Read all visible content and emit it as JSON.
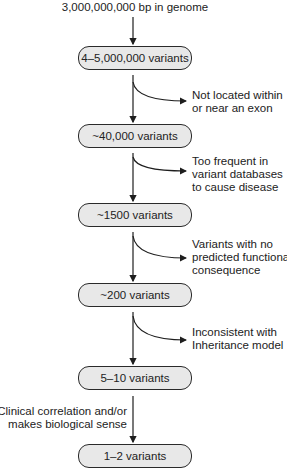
{
  "diagram": {
    "type": "variant-filtering-flowchart",
    "start_label": "3,000,000,000 bp in genome",
    "stages": [
      {
        "label": "4–5,000,000 variants"
      },
      {
        "label": "~40,000 variants"
      },
      {
        "label": "~1500 variants"
      },
      {
        "label": "~200 variants"
      },
      {
        "label": "5–10 variants"
      },
      {
        "label": "1–2 variants"
      }
    ],
    "filters": [
      {
        "lines": [
          "Not located within",
          "or near an exon"
        ],
        "side": "right"
      },
      {
        "lines": [
          "Too frequent in",
          "variant databases",
          "to cause disease"
        ],
        "side": "right"
      },
      {
        "lines": [
          "Variants with no",
          "predicted functional",
          "consequence"
        ],
        "side": "right"
      },
      {
        "lines": [
          "Inconsistent with",
          "Inheritance model"
        ],
        "side": "right"
      },
      {
        "lines": [
          "Clinical correlation and/or",
          "makes biological sense"
        ],
        "side": "left"
      }
    ],
    "colors": {
      "box_fill": "#e8e8e8",
      "box_border": "#2a2a2a",
      "arrow": "#1e1e1e",
      "text": "#222222"
    }
  }
}
